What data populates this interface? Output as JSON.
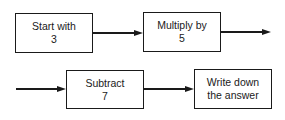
{
  "diagram": {
    "type": "flowchart",
    "steps": [
      {
        "line1": "Start with",
        "line2": "3"
      },
      {
        "line1": "Multiply by",
        "line2": "5"
      },
      {
        "line1": "Subtract",
        "line2": "7"
      },
      {
        "line1": "Write down",
        "line2": "the answer"
      }
    ],
    "edges": [
      {
        "from": 0,
        "to": 1
      },
      {
        "from": 1,
        "to": "continues"
      },
      {
        "from": "continued",
        "to": 2
      },
      {
        "from": 2,
        "to": 3
      }
    ]
  }
}
